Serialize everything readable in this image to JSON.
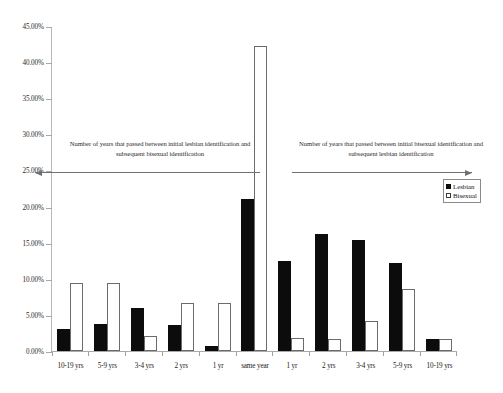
{
  "chart_data": {
    "type": "bar",
    "title": "",
    "xlabel": "",
    "ylabel": "",
    "ylim": [
      0,
      45
    ],
    "ytick_labels": [
      "0.00%",
      "5.00%",
      "10.00%",
      "15.00%",
      "20.00%",
      "25.00%",
      "30.00%",
      "35.00%",
      "40.00%",
      "45.00%"
    ],
    "ytick_values": [
      0,
      5,
      10,
      15,
      20,
      25,
      30,
      35,
      40,
      45
    ],
    "grid": false,
    "legend_position": "right",
    "categories": [
      "10-19 yrs",
      "5-9 yrs",
      "3-4 yrs",
      "2 yrs",
      "1 yr",
      "same year",
      "1 yr",
      "2 yrs",
      "3-4 yrs",
      "5-9 yrs",
      "10-19 yrs"
    ],
    "series": [
      {
        "name": "Lesbian",
        "color": "#0c0c0c",
        "values": [
          3.0,
          3.8,
          6.0,
          3.6,
          0.7,
          21.1,
          12.4,
          16.2,
          15.4,
          12.2,
          1.6
        ]
      },
      {
        "name": "Bisexual",
        "color": "#ffffff",
        "values": [
          9.4,
          9.4,
          2.1,
          6.7,
          6.6,
          42.3,
          1.8,
          1.7,
          4.2,
          8.6,
          1.6
        ]
      }
    ],
    "annotations": [
      {
        "id": "left",
        "text": "Number of years that passed between initial lesbian identification and subsequent bisexual identification",
        "arrow_direction": "left"
      },
      {
        "id": "right",
        "text": "Number of years that passed between initial bisexual identification and subsequent lesbian identification",
        "arrow_direction": "right"
      }
    ]
  },
  "legend": {
    "items": [
      {
        "label": "Lesbian"
      },
      {
        "label": "Bisexual"
      }
    ]
  }
}
